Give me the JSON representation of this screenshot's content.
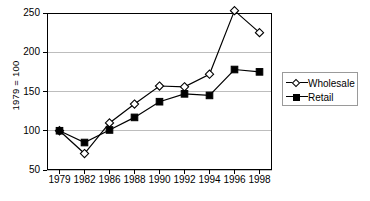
{
  "chart_data": {
    "type": "line",
    "title": "",
    "xlabel": "",
    "ylabel": "1979 = 100",
    "categories": [
      "1979",
      "1982",
      "1986",
      "1988",
      "1990",
      "1992",
      "1994",
      "1996",
      "1998"
    ],
    "series": [
      {
        "name": "Wholesale",
        "marker": "open-diamond",
        "color": "#000000",
        "values": [
          100,
          71,
          110,
          134,
          157,
          156,
          172,
          253,
          225
        ]
      },
      {
        "name": "Retail",
        "marker": "filled-square",
        "color": "#000000",
        "values": [
          100,
          85,
          101,
          117,
          137,
          147,
          145,
          178,
          175
        ]
      }
    ],
    "ylim": [
      50,
      250
    ],
    "yticks": [
      50,
      100,
      150,
      200,
      250
    ],
    "ytick_labels": [
      "50",
      "100",
      "150",
      "200",
      "250"
    ],
    "grid": true,
    "grid_axis": "y",
    "legend_position": "right",
    "legend_entries": [
      "Wholesale",
      "Retail"
    ]
  },
  "axes": {
    "y_title": "1979 = 100",
    "frame_color": "#000000",
    "grid_color": "#bdbdbd"
  }
}
